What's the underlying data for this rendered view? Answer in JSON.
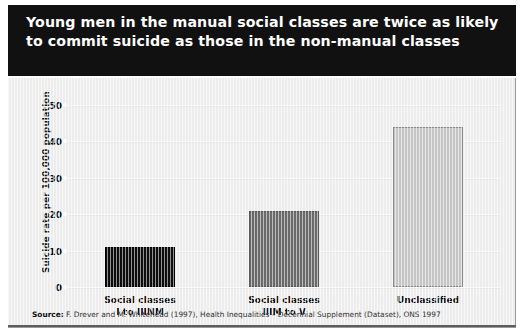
{
  "title": "Young men in the manual social classes are twice as likely to commit suicide as those in the non-manual classes",
  "source": {
    "keyword": "Source:",
    "text": " F. Drever and M. Whitehead (1997), Health Inequalities – Decennial Supplement (Dataset), ONS 1997"
  },
  "colors": {
    "banner_background": "#111111",
    "banner_text": "#ffffff",
    "panel_background": "#efefef",
    "bar_1": "#0d0d0d",
    "bar_2": "#6b6b6b",
    "bar_3": "#c7c7c7",
    "gridline": "#fcfcfc",
    "rule": "#5c5c5c"
  },
  "chart_data": {
    "type": "bar",
    "title": "Young men in the manual social classes are twice as likely to commit suicide as those in the non-manual classes",
    "categories": [
      "Social classes\nI to IIINM",
      "Social classes\nIIIM to V",
      "Unclassified"
    ],
    "values": [
      11,
      21,
      44
    ],
    "xlabel": "",
    "ylabel": "Suicide rate per 100,000 population",
    "ylim": [
      0,
      50
    ],
    "yticks": [
      0,
      10,
      20,
      30,
      40,
      50
    ],
    "ytick_labels": [
      "0",
      "10",
      "20",
      "30",
      "40",
      "50"
    ],
    "grid": true,
    "legend": false,
    "bar_colors": [
      "#0d0d0d",
      "#6b6b6b",
      "#c7c7c7"
    ]
  }
}
